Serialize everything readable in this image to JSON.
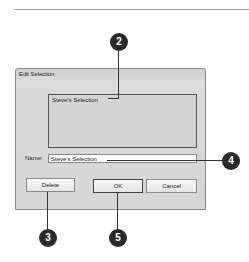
{
  "dialog": {
    "title": "Edit Selection",
    "list": {
      "items": [
        "Steve's Selection"
      ]
    },
    "name_field": {
      "label": "Name:",
      "value": "Steve's Selection"
    },
    "buttons": {
      "delete": "Delete",
      "ok": "OK",
      "cancel": "Cancel"
    }
  },
  "callouts": {
    "c2": "2",
    "c3": "3",
    "c4": "4",
    "c5": "5"
  },
  "colors": {
    "callout_fill": "#2a2a2a",
    "dialog_bg": "#d6d6d6"
  }
}
